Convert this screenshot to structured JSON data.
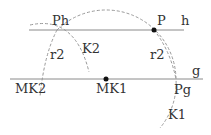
{
  "diagram": {
    "lines": [
      {
        "name": "h",
        "label": "h"
      },
      {
        "name": "g",
        "label": "g"
      }
    ],
    "points": {
      "P": "P",
      "Ph": "Ph",
      "Pg": "Pg",
      "MK1": "MK1",
      "MK2": "MK2"
    },
    "circles": {
      "K1": "K1",
      "K2": "K2"
    },
    "radii": {
      "left": "r2",
      "right": "r2"
    },
    "colors": {
      "line": "#888888",
      "dashed": "#999999",
      "point": "#111111",
      "text": "#333333"
    }
  }
}
